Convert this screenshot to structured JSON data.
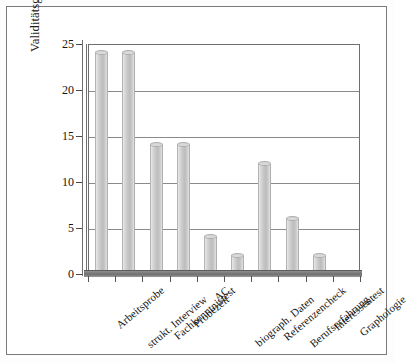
{
  "chart_data": {
    "type": "bar",
    "title": "",
    "subtitle": "",
    "xlabel": "",
    "ylabel": "Validitätsgewinn in %",
    "ylim": [
      0,
      25
    ],
    "yticks": [
      0,
      5,
      10,
      15,
      20,
      25
    ],
    "ytick_labels": [
      "0",
      "5",
      "10",
      "15",
      "20",
      "25"
    ],
    "grid": true,
    "legend": null,
    "categories": [
      "Arbeitsprobe",
      "strukt. Interview",
      "Fachkenntnistest",
      "Probezeit",
      "AC",
      "biograph. Daten",
      "Referenzencheck",
      "Berufserfahrung",
      "Interessentest",
      "Graphologie"
    ],
    "values": [
      24,
      24,
      14,
      14,
      4,
      2,
      12,
      6,
      2,
      0
    ],
    "bar_style": "cylinder-3d",
    "bar_color": "#c9c9c9"
  },
  "axes": {
    "y_title": "Validitätsgewinn in %"
  }
}
